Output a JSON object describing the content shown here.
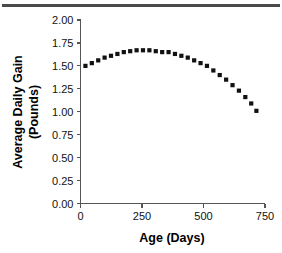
{
  "figure": {
    "top_rule_color": "#4a4a4a"
  },
  "chart_data": {
    "type": "scatter",
    "title": "",
    "xlabel": "Age (Days)",
    "ylabel": "Average Daily Gain (Pounds)",
    "ylabel_line1": "Average Daily Gain",
    "ylabel_line2": "(Pounds)",
    "xlim": [
      0,
      750
    ],
    "ylim": [
      0.0,
      2.0
    ],
    "xticks": [
      0,
      250,
      500,
      750
    ],
    "xtick_labels": [
      "0",
      "250",
      "500",
      "750"
    ],
    "yticks": [
      0.0,
      0.25,
      0.5,
      0.75,
      1.0,
      1.25,
      1.5,
      1.75,
      2.0
    ],
    "ytick_labels": [
      "0.00",
      "0.25",
      "0.50",
      "0.75",
      "1.00",
      "1.25",
      "1.50",
      "1.75",
      "2.00"
    ],
    "grid": false,
    "legend": null,
    "marker_style": "filled-square",
    "marker_color": "#111111",
    "x": [
      20,
      46,
      72,
      98,
      124,
      150,
      176,
      202,
      228,
      254,
      280,
      306,
      332,
      358,
      384,
      410,
      436,
      462,
      488,
      514,
      540,
      566,
      592,
      618,
      644,
      670,
      694,
      715
    ],
    "y": [
      1.5,
      1.53,
      1.56,
      1.59,
      1.61,
      1.63,
      1.65,
      1.66,
      1.67,
      1.67,
      1.67,
      1.66,
      1.65,
      1.65,
      1.63,
      1.61,
      1.59,
      1.56,
      1.53,
      1.5,
      1.45,
      1.4,
      1.35,
      1.29,
      1.23,
      1.16,
      1.09,
      1.01
    ],
    "series": [
      {
        "name": "Average Daily Gain",
        "values": [
          1.5,
          1.53,
          1.56,
          1.59,
          1.61,
          1.63,
          1.65,
          1.66,
          1.67,
          1.67,
          1.67,
          1.66,
          1.65,
          1.65,
          1.63,
          1.61,
          1.59,
          1.56,
          1.53,
          1.5,
          1.45,
          1.4,
          1.35,
          1.29,
          1.23,
          1.16,
          1.09,
          1.01
        ]
      }
    ]
  }
}
